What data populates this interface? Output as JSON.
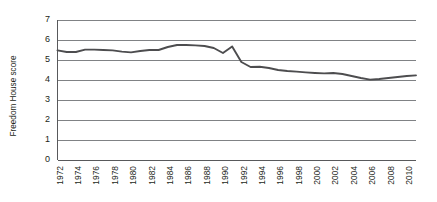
{
  "chart_data": {
    "type": "line",
    "title": "",
    "xlabel": "",
    "ylabel": "Freedom House score",
    "ylim": [
      0,
      7
    ],
    "xlim": [
      1972,
      2011
    ],
    "grid": true,
    "legend": false,
    "ytick_labels": [
      "7",
      "6",
      "5",
      "4",
      "3",
      "2",
      "1",
      "0"
    ],
    "ytick_values": [
      7,
      6,
      5,
      4,
      3,
      2,
      1,
      0
    ],
    "xtick_labels": [
      "1972",
      "1974",
      "1976",
      "1978",
      "1980",
      "1982",
      "1984",
      "1986",
      "1988",
      "1990",
      "1992",
      "1994",
      "1996",
      "1998",
      "2000",
      "2002",
      "2004",
      "2006",
      "2008",
      "2010"
    ],
    "xtick_values": [
      1972,
      1974,
      1976,
      1978,
      1980,
      1982,
      1984,
      1986,
      1988,
      1990,
      1992,
      1994,
      1996,
      1998,
      2000,
      2002,
      2004,
      2006,
      2008,
      2010
    ],
    "series": [
      {
        "name": "Freedom House score",
        "color": "#4d4d4f",
        "x": [
          1972,
          1973,
          1974,
          1975,
          1976,
          1977,
          1978,
          1979,
          1980,
          1981,
          1982,
          1983,
          1984,
          1985,
          1986,
          1987,
          1988,
          1989,
          1990,
          1991,
          1992,
          1993,
          1994,
          1995,
          1996,
          1997,
          1998,
          1999,
          2000,
          2001,
          2002,
          2003,
          2004,
          2005,
          2006,
          2007,
          2008,
          2009,
          2010,
          2011
        ],
        "values": [
          5.48,
          5.4,
          5.4,
          5.52,
          5.52,
          5.5,
          5.48,
          5.42,
          5.38,
          5.45,
          5.5,
          5.5,
          5.65,
          5.75,
          5.75,
          5.73,
          5.7,
          5.6,
          5.35,
          5.68,
          4.9,
          4.65,
          4.66,
          4.6,
          4.5,
          4.45,
          4.42,
          4.38,
          4.35,
          4.33,
          4.35,
          4.3,
          4.2,
          4.1,
          4.02,
          4.05,
          4.1,
          4.15,
          4.2,
          4.23
        ]
      }
    ]
  }
}
